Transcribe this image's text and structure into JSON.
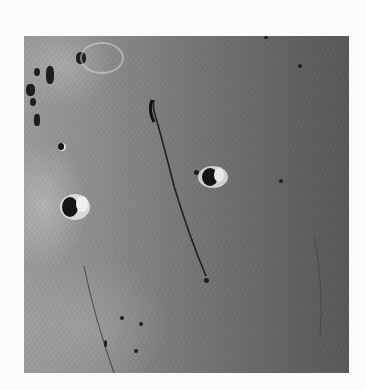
{
  "image": {
    "subject": "lunar surface photograph",
    "tone": "grayscale",
    "features": [
      "rille",
      "crater-center",
      "crater-left",
      "small-craters",
      "highlands-left"
    ]
  }
}
